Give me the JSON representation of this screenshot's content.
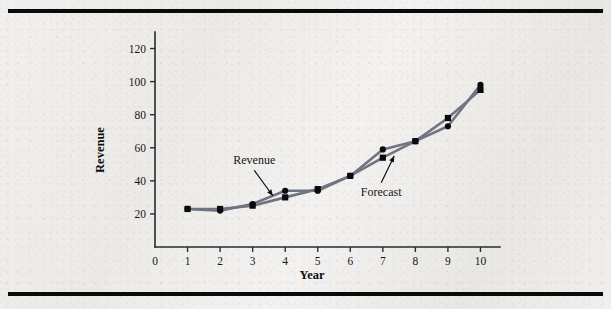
{
  "figure": {
    "background_color": "#efedea",
    "rule_color": "#0a0a0a",
    "line_color": "#6f7580",
    "marker_color": "#0b0b0f"
  },
  "chart_data": {
    "type": "line",
    "title": "",
    "xlabel": "Year",
    "ylabel": "Revenue",
    "x": [
      1,
      2,
      3,
      4,
      5,
      6,
      7,
      8,
      9,
      10
    ],
    "xlim": [
      0,
      10.6
    ],
    "ylim": [
      0,
      130
    ],
    "xticks": [
      "0",
      "1",
      "2",
      "3",
      "4",
      "5",
      "6",
      "7",
      "8",
      "9",
      "10"
    ],
    "xtick_values": [
      0,
      1,
      2,
      3,
      4,
      5,
      6,
      7,
      8,
      9,
      10
    ],
    "yticks": [
      "20",
      "40",
      "60",
      "80",
      "100",
      "120"
    ],
    "ytick_values": [
      20,
      40,
      60,
      80,
      100,
      120
    ],
    "grid": false,
    "legend_position": "inline-annotations",
    "series": [
      {
        "name": "Revenue",
        "marker": "circle",
        "values": [
          23,
          22,
          26,
          34,
          34,
          43,
          59,
          64,
          73,
          98
        ]
      },
      {
        "name": "Forecast",
        "marker": "square",
        "values": [
          23,
          23,
          25,
          30,
          35,
          43,
          54,
          64,
          78,
          95
        ]
      }
    ],
    "annotations": [
      {
        "text": "Revenue",
        "label_x": 3.05,
        "label_y": 50,
        "point_x": 3.62,
        "point_y": 31
      },
      {
        "text": "Forecast",
        "label_x": 6.95,
        "label_y": 31,
        "point_x": 7.35,
        "point_y": 55
      }
    ]
  }
}
